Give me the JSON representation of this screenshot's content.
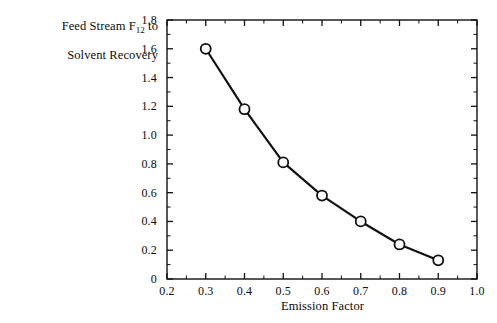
{
  "chart_data": {
    "type": "line",
    "title": "",
    "xlabel": "Emission Factor",
    "ylabel_line1": "Feed Stream F",
    "ylabel_sub": "12",
    "ylabel_line1_tail": " to",
    "ylabel_line2": "Solvent Recovery",
    "x": [
      0.3,
      0.4,
      0.5,
      0.6,
      0.7,
      0.8,
      0.9
    ],
    "values": [
      1.6,
      1.18,
      0.81,
      0.58,
      0.4,
      0.24,
      0.13
    ],
    "series": [
      {
        "name": "Feed Stream F12 to Solvent Recovery",
        "values": [
          1.6,
          1.18,
          0.81,
          0.58,
          0.4,
          0.24,
          0.13
        ]
      }
    ],
    "xlim": [
      0.2,
      1.0
    ],
    "ylim": [
      0.0,
      1.8
    ],
    "xticks": [
      0.2,
      0.3,
      0.4,
      0.5,
      0.6,
      0.7,
      0.8,
      0.9,
      1.0
    ],
    "xticklabels": [
      "0.2",
      "0.3",
      "0.4",
      "0.5",
      "0.6",
      "0.7",
      "0.8",
      "0.9",
      "1.0"
    ],
    "xminor_step": 0.05,
    "yticks": [
      0.0,
      0.2,
      0.4,
      0.6,
      0.8,
      1.0,
      1.2,
      1.4,
      1.6,
      1.8
    ],
    "yticklabels": [
      "0",
      "0.2",
      "0.4",
      "0.6",
      "0.8",
      "1.0",
      "1.2",
      "1.4",
      "1.6",
      "1.8"
    ],
    "yminor_step": 0.1,
    "grid": false,
    "legend": "none",
    "marker": "open-circle",
    "line_color": "#111111",
    "marker_face_color": "#ffffff",
    "marker_edge_color": "#111111",
    "background_color": "#ffffff"
  }
}
